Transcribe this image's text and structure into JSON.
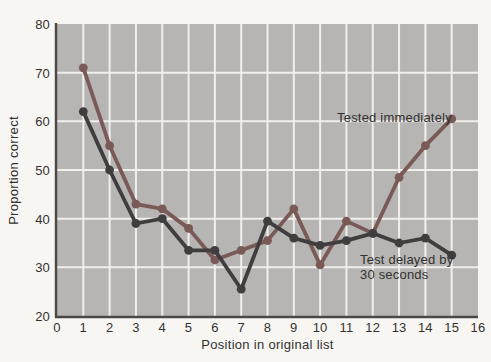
{
  "chart_data": {
    "type": "line",
    "title": "",
    "xlabel": "Position in original list",
    "ylabel": "Proportion correct",
    "xlim": [
      0,
      16
    ],
    "ylim": [
      20,
      80
    ],
    "x_ticks": [
      0,
      1,
      2,
      3,
      4,
      5,
      6,
      7,
      8,
      9,
      10,
      11,
      12,
      13,
      14,
      15,
      16
    ],
    "y_ticks": [
      20,
      30,
      40,
      50,
      60,
      70,
      80
    ],
    "grid": true,
    "legend_position": "inline-annotations",
    "x": [
      1,
      2,
      3,
      4,
      5,
      6,
      7,
      8,
      9,
      10,
      11,
      12,
      13,
      14,
      15
    ],
    "series": [
      {
        "name": "Tested immediately",
        "color": "#7a5a56",
        "values": [
          71,
          55,
          43,
          42,
          38,
          31.5,
          33.5,
          35.5,
          42,
          30.5,
          39.5,
          37,
          48.5,
          55,
          60.5
        ]
      },
      {
        "name": "Test delayed by 30 seconds",
        "color": "#3f3d3e",
        "values": [
          62,
          50,
          39,
          40,
          33.5,
          33.5,
          25.5,
          39.5,
          36,
          34.5,
          35.5,
          37,
          35,
          36,
          32.5
        ]
      }
    ],
    "annotations": {
      "immediate_label": "Tested immediately",
      "delayed_label_line1": "Test delayed by",
      "delayed_label_line2": "30 seconds"
    }
  },
  "colors": {
    "paper": "#f7f6f3",
    "plot_background": "#b6b5b3",
    "gridline": "#f0efec",
    "axis": "#4a4846",
    "tick_text": "#34322f",
    "series_immediate": "#7a5a56",
    "series_delayed": "#3f3d3e"
  }
}
